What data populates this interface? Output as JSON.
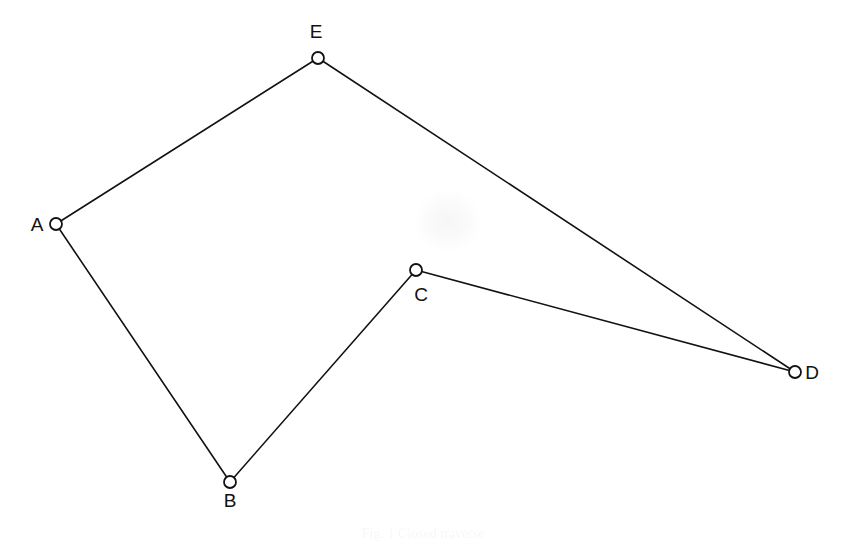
{
  "figure": {
    "background_color": "#ffffff",
    "line_color": "#121212",
    "node_fill_color": "#ffffff",
    "node_radius": 6,
    "width": 846,
    "height": 544
  },
  "nodes": [
    {
      "id": "A",
      "label": "A",
      "x": 56,
      "y": 224,
      "label_x": 37,
      "label_y": 231,
      "label_anchor": "middle"
    },
    {
      "id": "B",
      "label": "B",
      "x": 230,
      "y": 482,
      "label_x": 230,
      "label_y": 507,
      "label_anchor": "middle"
    },
    {
      "id": "C",
      "label": "C",
      "x": 416,
      "y": 270,
      "label_x": 421,
      "label_y": 301,
      "label_anchor": "middle"
    },
    {
      "id": "D",
      "label": "D",
      "x": 795,
      "y": 372,
      "label_x": 812,
      "label_y": 379,
      "label_anchor": "middle"
    },
    {
      "id": "E",
      "label": "E",
      "x": 318,
      "y": 58,
      "label_x": 316,
      "label_y": 38,
      "label_anchor": "middle"
    }
  ],
  "edges": [
    {
      "id": "A-E",
      "from": "A",
      "to": "E"
    },
    {
      "id": "E-D",
      "from": "E",
      "to": "D"
    },
    {
      "id": "A-B",
      "from": "A",
      "to": "B"
    },
    {
      "id": "B-C",
      "from": "B",
      "to": "C"
    },
    {
      "id": "C-D",
      "from": "C",
      "to": "D"
    }
  ],
  "watermark": {
    "x": 415,
    "y": 190,
    "width": 66,
    "height": 62
  },
  "caption_ghost": {
    "text": "Fig. 1  Closed traverse"
  }
}
